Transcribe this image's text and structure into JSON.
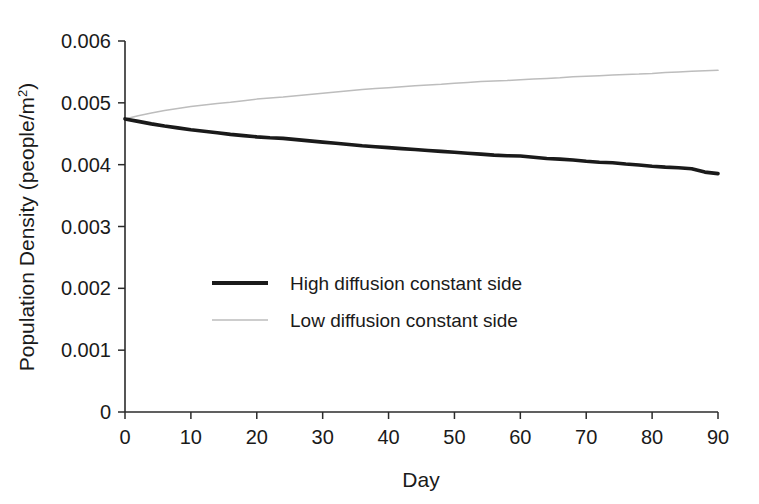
{
  "chart_data": {
    "type": "line",
    "title": "",
    "xlabel": "Day",
    "ylabel": "Population Density (people/m²)",
    "xlim": [
      0,
      90
    ],
    "ylim": [
      0,
      0.006
    ],
    "grid": false,
    "legend_position": "center-left-inside",
    "xticks": [
      0,
      10,
      20,
      30,
      40,
      50,
      60,
      70,
      80,
      90
    ],
    "xtick_labels": [
      "0",
      "10",
      "20",
      "30",
      "40",
      "50",
      "60",
      "70",
      "80",
      "90"
    ],
    "yticks": [
      0,
      0.001,
      0.002,
      0.003,
      0.004,
      0.005,
      0.006
    ],
    "ytick_labels": [
      "0",
      "0.001",
      "0.002",
      "0.003",
      "0.004",
      "0.005",
      "0.006"
    ],
    "x": [
      0,
      2,
      4,
      6,
      8,
      10,
      12,
      14,
      16,
      18,
      20,
      22,
      24,
      26,
      28,
      30,
      32,
      34,
      36,
      38,
      40,
      42,
      44,
      46,
      48,
      50,
      52,
      54,
      56,
      58,
      60,
      62,
      64,
      66,
      68,
      70,
      72,
      74,
      76,
      78,
      80,
      82,
      84,
      86,
      88,
      90
    ],
    "series": [
      {
        "name": "High diffusion constant side",
        "color": "#1a1a1a",
        "linewidth": 3.6,
        "values": [
          0.00474,
          0.0047,
          0.00466,
          0.004625,
          0.004595,
          0.004565,
          0.00454,
          0.004515,
          0.00449,
          0.00447,
          0.00445,
          0.004435,
          0.004425,
          0.004405,
          0.004385,
          0.004365,
          0.004345,
          0.004325,
          0.004305,
          0.00429,
          0.004275,
          0.00426,
          0.004245,
          0.00423,
          0.004215,
          0.0042,
          0.004185,
          0.00417,
          0.004155,
          0.004145,
          0.00414,
          0.00412,
          0.0041,
          0.00409,
          0.004075,
          0.004055,
          0.00404,
          0.00403,
          0.00401,
          0.003995,
          0.003975,
          0.00396,
          0.00395,
          0.003935,
          0.00388,
          0.003855
        ]
      },
      {
        "name": "Low diffusion constant side",
        "color": "#bdbdbd",
        "linewidth": 1.5,
        "values": [
          0.00474,
          0.00479,
          0.004835,
          0.004875,
          0.00491,
          0.00494,
          0.004965,
          0.00499,
          0.00501,
          0.005035,
          0.00506,
          0.00508,
          0.005095,
          0.005115,
          0.005135,
          0.005155,
          0.005175,
          0.005195,
          0.005215,
          0.00523,
          0.005245,
          0.00526,
          0.005275,
          0.00529,
          0.0053,
          0.005315,
          0.00533,
          0.005345,
          0.005355,
          0.00536,
          0.005375,
          0.005385,
          0.005395,
          0.005405,
          0.00542,
          0.00543,
          0.00544,
          0.00545,
          0.00546,
          0.005465,
          0.005475,
          0.00549,
          0.0055,
          0.00551,
          0.005518,
          0.005525
        ]
      }
    ]
  },
  "legend": {
    "items": [
      {
        "label": "High diffusion constant side",
        "color": "#1a1a1a"
      },
      {
        "label": "Low diffusion constant side",
        "color": "#bdbdbd"
      }
    ]
  },
  "axes": {
    "x_title": "Day",
    "y_title_main": "Population Density (people/m",
    "y_title_sup": "2",
    "y_title_close": ")"
  }
}
